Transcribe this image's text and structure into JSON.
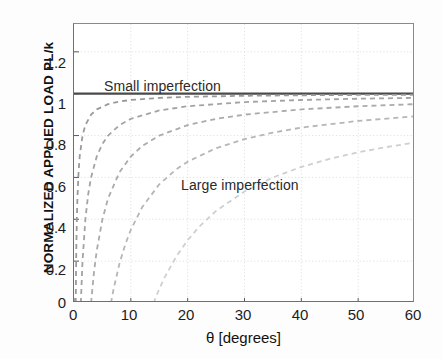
{
  "chart_data": {
    "type": "line",
    "title": "",
    "xlabel": "θ [degrees]",
    "ylabel": "NORMALIZED APPLIED LOAD PL/k",
    "xlim": [
      0,
      60
    ],
    "ylim": [
      0,
      1.333
    ],
    "xticks": [
      0,
      10,
      20,
      30,
      40,
      50,
      60
    ],
    "xticklabels": [
      "0",
      "10",
      "20",
      "30",
      "40",
      "50",
      "60"
    ],
    "yticks": [
      0,
      0.2,
      0.4,
      0.6,
      0.8,
      1,
      1.2
    ],
    "yticklabels": [
      "0",
      "0.2",
      "0.4",
      "0.6",
      "0.8",
      "1",
      "1.2"
    ],
    "grid": true,
    "grid_color": "#d9d9d9",
    "legend": "none",
    "annotations": [
      {
        "text": "Small imperfection",
        "x": 5.5,
        "y": 1.145
      },
      {
        "text": "Large imperfection",
        "x": 19.5,
        "y": 0.6
      }
    ],
    "series": [
      {
        "name": "Perfect system (bifurcation load)",
        "style": "solid",
        "color": "#4a4a4a",
        "width": 2.2,
        "theta0_deg": 0,
        "x": [
          0,
          60
        ],
        "values": [
          1,
          1
        ]
      },
      {
        "name": "Imperfection 1 (smallest)",
        "style": "dashed",
        "color": "#9a9a9a",
        "width": 1.8,
        "theta0_deg": 0.3,
        "x": [
          0.3,
          0.4,
          0.5,
          0.6,
          0.8,
          1,
          1.5,
          2,
          3,
          4,
          6,
          8,
          10,
          15,
          20,
          30,
          40,
          50,
          60
        ],
        "values": [
          0,
          0.25,
          0.4,
          0.5,
          0.625,
          0.7,
          0.8,
          0.85,
          0.9,
          0.925,
          0.95,
          0.9625,
          0.97,
          0.98,
          0.985,
          0.99,
          0.9925,
          0.994,
          0.995
        ]
      },
      {
        "name": "Imperfection 2",
        "style": "dashed",
        "color": "#a3a3a3",
        "width": 1.8,
        "theta0_deg": 1.2,
        "x": [
          1.2,
          1.5,
          2,
          2.5,
          3,
          4,
          5,
          6,
          8,
          10,
          15,
          20,
          30,
          40,
          50,
          60
        ],
        "values": [
          0,
          0.2,
          0.4,
          0.52,
          0.6,
          0.7,
          0.76,
          0.8,
          0.85,
          0.88,
          0.92,
          0.94,
          0.96,
          0.97,
          0.976,
          0.98
        ]
      },
      {
        "name": "Imperfection 3",
        "style": "dashed",
        "color": "#ababab",
        "width": 1.8,
        "theta0_deg": 3,
        "x": [
          3,
          3.5,
          4,
          5,
          6,
          8,
          10,
          12,
          15,
          20,
          25,
          30,
          40,
          50,
          60
        ],
        "values": [
          0,
          0.143,
          0.25,
          0.4,
          0.5,
          0.625,
          0.7,
          0.75,
          0.8,
          0.85,
          0.88,
          0.9,
          0.925,
          0.94,
          0.95
        ]
      },
      {
        "name": "Imperfection 4",
        "style": "dashed",
        "color": "#b6b6b6",
        "width": 1.8,
        "theta0_deg": 6.5,
        "x": [
          6.5,
          7,
          8,
          9,
          10,
          12,
          15,
          18,
          20,
          25,
          30,
          35,
          40,
          50,
          60
        ],
        "values": [
          0,
          0.071,
          0.188,
          0.278,
          0.35,
          0.458,
          0.567,
          0.639,
          0.675,
          0.74,
          0.783,
          0.814,
          0.838,
          0.87,
          0.892
        ]
      },
      {
        "name": "Imperfection 5 (largest)",
        "style": "dashed",
        "color": "#cfcfcf",
        "width": 1.8,
        "theta0_deg": 14,
        "x": [
          14,
          15,
          16,
          18,
          20,
          22,
          25,
          30,
          35,
          40,
          45,
          50,
          55,
          60
        ],
        "values": [
          0,
          0.067,
          0.125,
          0.222,
          0.3,
          0.364,
          0.44,
          0.533,
          0.6,
          0.65,
          0.689,
          0.72,
          0.745,
          0.767
        ]
      }
    ]
  },
  "axes": {
    "ylabel_text": "NORMALIZED APPLIED LOAD PL/k",
    "xlabel_text": "θ [degrees]"
  },
  "annotations": {
    "small": "Small imperfection",
    "large": "Large imperfection"
  }
}
